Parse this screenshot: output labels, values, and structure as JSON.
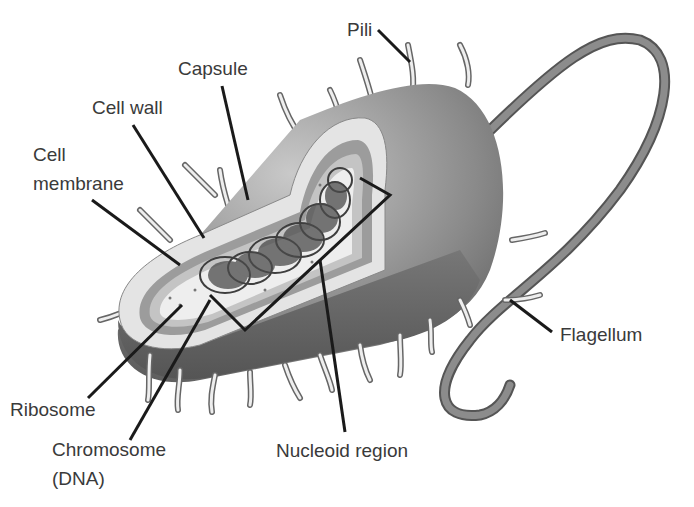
{
  "diagram": {
    "labels": {
      "pili": "Pili",
      "capsule": "Capsule",
      "cell_wall": "Cell wall",
      "cell_membrane_1": "Cell",
      "cell_membrane_2": "membrane",
      "ribosome": "Ribosome",
      "chromosome_1": "Chromosome",
      "chromosome_2": "(DNA)",
      "nucleoid": "Nucleoid region",
      "flagellum": "Flagellum"
    },
    "colors": {
      "body_dark": "#6e6e6e",
      "body_light": "#bdbdbd",
      "capsule": "#e6e6e6",
      "wall": "#9a9a9a",
      "cytoplasm": "#efefef",
      "dna": "#4a4a4a",
      "leader": "#1a1a1a",
      "text": "#3a3a3a"
    }
  }
}
